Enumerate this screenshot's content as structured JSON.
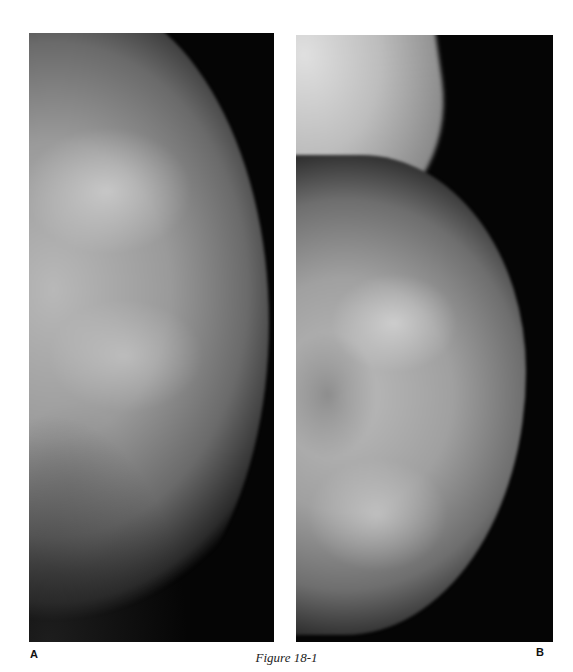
{
  "figure": {
    "caption": "Figure 18-1",
    "panels": [
      {
        "label": "A",
        "description": "Mammogram view of breast tissue"
      },
      {
        "label": "B",
        "description": "Mammogram view of breast tissue with pectoral muscle at top"
      }
    ]
  }
}
